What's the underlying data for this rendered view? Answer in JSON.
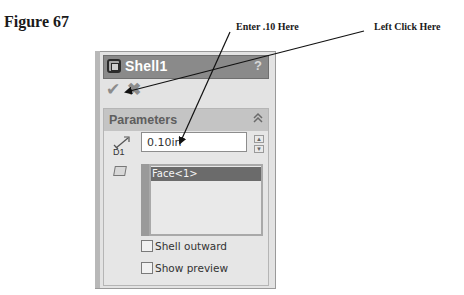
{
  "figure": {
    "label": "Figure 67"
  },
  "callouts": {
    "enter": "Enter .10 Here",
    "click": "Left Click Here"
  },
  "panel": {
    "title": "Shell1",
    "title_icon": "shell-feature-icon",
    "help_label": "?",
    "ok_icon": "checkmark-icon",
    "cancel_icon": "x-icon",
    "ok_glyph": "✔",
    "cancel_glyph": "✖"
  },
  "parameters": {
    "title": "Parameters",
    "collapse_glyph": "≈",
    "thickness_label": "D1",
    "thickness_value": "0.10in",
    "spin_up": "▲",
    "spin_down": "▼",
    "faces_to_remove": [
      "Face<1>"
    ],
    "checkboxes": [
      {
        "label": "Shell outward",
        "checked": false
      },
      {
        "label": "Show preview",
        "checked": false
      }
    ]
  },
  "colors": {
    "titlebar": "#8a8a8a",
    "section_header": "#c4c4c4",
    "selected_face": "#6b6b6b",
    "panel_bg": "#e3e3e3"
  }
}
